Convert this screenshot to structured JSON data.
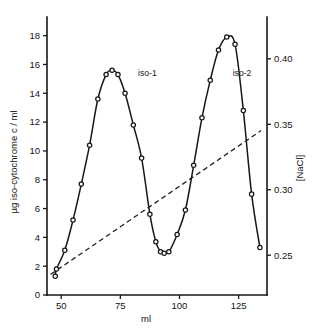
{
  "figure": {
    "name": "iso-cytochrome c elution profile",
    "background_color": "#ffffff",
    "ink_color": "#171717"
  },
  "chart_data": {
    "type": "line",
    "title": "",
    "xlabel": "ml",
    "ylabel": "µg iso-cytochrome c / ml",
    "y2label": "[NaCl]",
    "xlim": [
      44,
      137
    ],
    "ylim": [
      0,
      18.6
    ],
    "y2lim": [
      0.2196,
      0.4243
    ],
    "xticks": [
      50,
      75,
      100,
      125
    ],
    "xticklabels": [
      "50",
      "75",
      "100",
      "125"
    ],
    "yticks": [
      0,
      2,
      4,
      6,
      8,
      10,
      12,
      14,
      16,
      18
    ],
    "yticklabels": [
      "0",
      "2",
      "4",
      "6",
      "8",
      "10",
      "12",
      "14",
      "16",
      "18"
    ],
    "y2ticks": [
      0.25,
      0.3,
      0.35,
      0.4
    ],
    "y2ticklabels": [
      "0.25",
      "0.30",
      "0.35",
      "0.40"
    ],
    "grid": false,
    "legend": false,
    "marker": "open-circle",
    "series": [
      {
        "name": "iso-cytochrome c",
        "axis": "left",
        "style": "solid-with-open-circle-markers",
        "x": [
          47.5,
          48.0,
          51.5,
          55.0,
          58.5,
          62.0,
          65.5,
          69.0,
          71.5,
          74.0,
          77.0,
          80.5,
          84.0,
          87.5,
          90.0,
          92.0,
          93.5,
          95.5,
          99.0,
          102.5,
          106.0,
          109.5,
          113.0,
          116.5,
          120.0,
          123.5,
          127.0,
          130.5,
          134.0
        ],
        "y": [
          1.3,
          1.8,
          3.1,
          5.2,
          7.7,
          10.4,
          13.6,
          15.3,
          15.6,
          15.3,
          14.0,
          11.8,
          9.5,
          5.6,
          3.7,
          3.0,
          2.9,
          3.0,
          4.2,
          5.9,
          9.0,
          12.3,
          14.9,
          17.0,
          17.9,
          17.4,
          12.8,
          7.0,
          3.3
        ]
      },
      {
        "name": "NaCl gradient",
        "axis": "right",
        "style": "dashed",
        "x": [
          45.5,
          134.5
        ],
        "y": [
          0.2353,
          0.3452
        ]
      }
    ],
    "annotations": [
      {
        "text": "iso-1",
        "x": 82.5,
        "y": 15.2
      },
      {
        "text": "iso-2",
        "x": 122.5,
        "y": 15.2
      }
    ]
  },
  "caption": {
    "text": ""
  }
}
